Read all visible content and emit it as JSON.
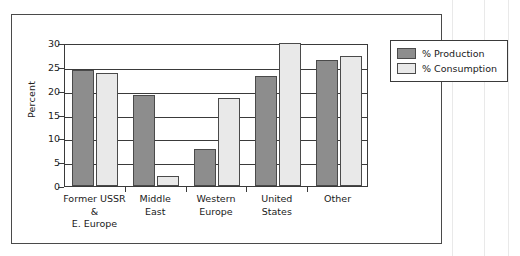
{
  "chart_data": {
    "type": "bar",
    "title": "",
    "xlabel": "",
    "ylabel": "Percent",
    "ylim": [
      0,
      30
    ],
    "yticks": [
      0,
      5,
      10,
      15,
      20,
      25,
      30
    ],
    "grid": true,
    "legend_position": "right",
    "categories": [
      "Former USSR\n&\nE. Europe",
      "Middle\nEast",
      "Western\nEurope",
      "United\nStates",
      "Other"
    ],
    "series": [
      {
        "name": "% Production",
        "color": "#8d8d8d",
        "values": [
          24.4,
          19.1,
          7.7,
          23.0,
          26.4
        ]
      },
      {
        "name": "% Consumption",
        "color": "#e9e9e9",
        "values": [
          23.7,
          2.1,
          18.4,
          30.0,
          27.3
        ]
      }
    ]
  },
  "legend": {
    "items": [
      {
        "label": "% Production"
      },
      {
        "label": "% Consumption"
      }
    ]
  },
  "axis": {
    "y_label": "Percent",
    "y_ticks": [
      "30",
      "25",
      "20",
      "15",
      "10",
      "5",
      "0"
    ]
  }
}
